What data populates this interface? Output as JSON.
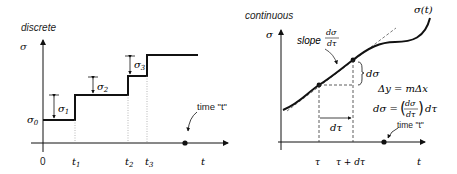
{
  "left_panel": {
    "title": "discrete",
    "y_axis_label": "σ",
    "x_axis_label": "t",
    "origin_label": "0",
    "base_label": "σ",
    "base_sub": "0",
    "steps": [
      {
        "label": "σ",
        "sub": "1"
      },
      {
        "label": "σ",
        "sub": "2"
      },
      {
        "label": "σ",
        "sub": "3"
      }
    ],
    "ticks": [
      {
        "label": "t",
        "sub": "1"
      },
      {
        "label": "t",
        "sub": "2"
      },
      {
        "label": "t",
        "sub": "3"
      }
    ],
    "time_annotation": "time \"t\""
  },
  "right_panel": {
    "title": "continuous",
    "y_axis_label": "σ",
    "x_axis_label": "t",
    "curve_label": "σ(t)",
    "slope_label": "slope",
    "slope_num": "dσ",
    "slope_den": "dτ",
    "dsigma_label": "dσ",
    "dtau_label": "dτ",
    "eq1": "Δy = mΔx",
    "eq2_lhs": "dσ =",
    "eq2_num": "dσ",
    "eq2_den": "dτ",
    "eq2_rhs": "dτ",
    "tick_tau": "τ",
    "tick_tau_dtau": "τ + dτ",
    "time_annotation": "time \"t\""
  }
}
